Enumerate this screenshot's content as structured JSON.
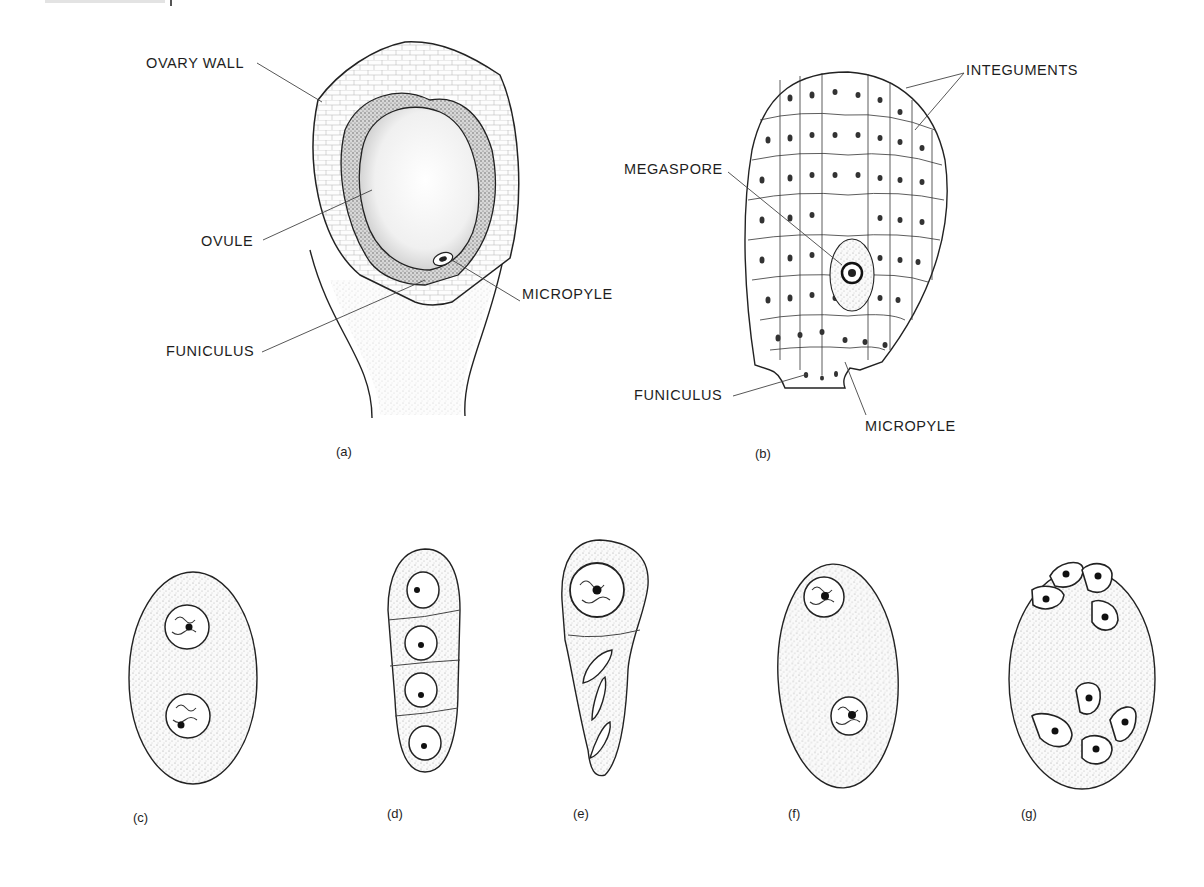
{
  "figure": {
    "panels": [
      {
        "id": "a",
        "caption": "(a)",
        "description": "Ovary with single ovule",
        "labels": {
          "ovary_wall": "OVARY WALL",
          "ovule": "OVULE",
          "micropyle": "MICROPYLE",
          "funiculus": "FUNICULUS"
        }
      },
      {
        "id": "b",
        "caption": "(b)",
        "description": "Ovule cross-section with megaspore",
        "labels": {
          "integuments": "INTEGUMENTS",
          "megaspore": "MEGASPORE",
          "funiculus": "FUNICULUS",
          "micropyle": "MICROPYLE"
        }
      },
      {
        "id": "c",
        "caption": "(c)",
        "nuclei": 2
      },
      {
        "id": "d",
        "caption": "(d)",
        "nuclei": 4
      },
      {
        "id": "e",
        "caption": "(e)",
        "nuclei": 4
      },
      {
        "id": "f",
        "caption": "(f)",
        "nuclei": 2
      },
      {
        "id": "g",
        "caption": "(g)",
        "nuclei": 8
      }
    ]
  },
  "colors": {
    "ink": "#1e1e1e",
    "stipple": "#9a9a9a",
    "background": "#ffffff"
  }
}
